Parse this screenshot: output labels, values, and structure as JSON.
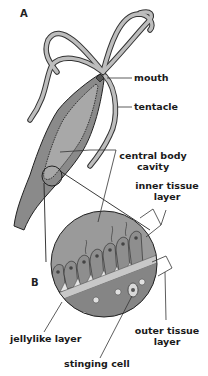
{
  "panels": {
    "a": "A",
    "b": "B"
  },
  "labels": {
    "mouth": "mouth",
    "tentacle": "tentacle",
    "central_body_cavity_line1": "central body",
    "central_body_cavity_line2": "cavity",
    "inner_tissue_layer_line1": "inner tissue",
    "inner_tissue_layer_line2": "layer",
    "jellylike_layer": "jellylike layer",
    "outer_tissue_layer_line1": "outer tissue",
    "outer_tissue_layer_line2": "layer",
    "stinging_cell": "stinging cell"
  },
  "colors": {
    "background": "#ffffff",
    "body_fill": "#8a8a8a",
    "body_dark": "#555555",
    "magnified_fill": "#9a9a9a",
    "jelly_layer": "#c8c8c8",
    "outline": "#222222",
    "leader_line": "#333333"
  }
}
